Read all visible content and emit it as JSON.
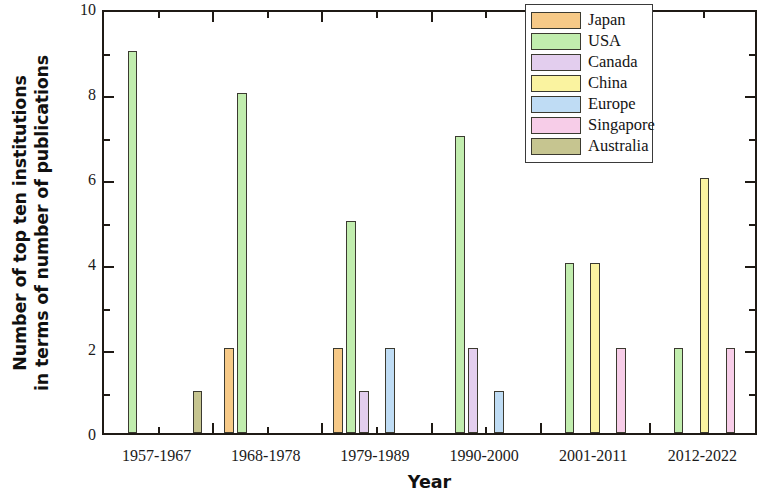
{
  "chart_data": {
    "type": "bar",
    "title": "",
    "xlabel": "Year",
    "ylabel": "Number of top ten institutions in terms of number of publications",
    "ylabel_lines": [
      "Number of top ten institutions",
      "in terms of number of publications"
    ],
    "categories": [
      "1957-1967",
      "1968-1978",
      "1979-1989",
      "1990-2000",
      "2001-2011",
      "2012-2022"
    ],
    "ylim": [
      0,
      10
    ],
    "xlim": [
      0,
      6
    ],
    "ytick_labels": [
      "0",
      "2",
      "4",
      "6",
      "8",
      "10"
    ],
    "ytick_values": [
      0,
      2,
      4,
      6,
      8,
      10
    ],
    "yminor_values": [
      1,
      3,
      5,
      7,
      9
    ],
    "grid": false,
    "legend_position": "upper right",
    "series": [
      {
        "name": "Japan",
        "color": "#F6C987",
        "values": [
          0,
          2,
          2,
          0,
          0,
          0
        ]
      },
      {
        "name": "USA",
        "color": "#C1EDAE",
        "values": [
          9,
          8,
          5,
          7,
          4,
          2
        ]
      },
      {
        "name": "Canada",
        "color": "#E3CEEE",
        "values": [
          0,
          0,
          1,
          2,
          0,
          0
        ]
      },
      {
        "name": "China",
        "color": "#FAF3A0",
        "values": [
          0,
          0,
          0,
          0,
          4,
          6
        ]
      },
      {
        "name": "Europe",
        "color": "#BFDCF4",
        "values": [
          0,
          0,
          2,
          1,
          0,
          0
        ]
      },
      {
        "name": "Singapore",
        "color": "#F7CDE8",
        "values": [
          0,
          0,
          0,
          0,
          2,
          2
        ]
      },
      {
        "name": "Australia",
        "color": "#C6C590",
        "values": [
          1,
          0,
          0,
          0,
          0,
          0
        ]
      }
    ]
  },
  "legend": {
    "items": [
      {
        "label": "Japan",
        "color": "#F6C987"
      },
      {
        "label": "USA",
        "color": "#C1EDAE"
      },
      {
        "label": "Canada",
        "color": "#E3CEEE"
      },
      {
        "label": "China",
        "color": "#FAF3A0"
      },
      {
        "label": "Europe",
        "color": "#BFDCF4"
      },
      {
        "label": "Singapore",
        "color": "#F7CDE8"
      },
      {
        "label": "Australia",
        "color": "#C6C590"
      }
    ]
  },
  "axes": {
    "x_title": "Year",
    "y_title_line1": "Number of top ten institutions",
    "y_title_line2": "in terms of number of publications"
  }
}
